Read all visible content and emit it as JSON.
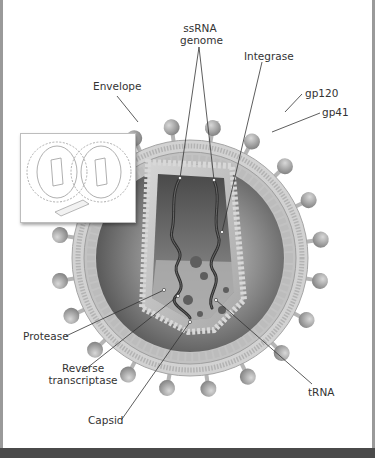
{
  "figure": {
    "labels": {
      "ssrna_line1": "ssRNA",
      "ssrna_line2": "genome",
      "integrase": "Integrase",
      "envelope": "Envelope",
      "gp120": "gp120",
      "gp41": "gp41",
      "protease": "Protease",
      "reverse_line1": "Reverse",
      "reverse_line2": "transcriptase",
      "trna": "tRNA",
      "capsid": "Capsid"
    },
    "inset": {
      "description": "two virions cross-section with scale bar",
      "scale_label": "80 nm"
    }
  },
  "colors": {
    "frame_border": "#9a9a9a",
    "bottom_bar": "#4a4a4a",
    "membrane": "#c8c8c8",
    "spike": "#a9a9a9",
    "interior": "#6e6e6e",
    "capsid": "#b8b8b8",
    "rna": "#3a3a3a",
    "label_text": "#333333"
  }
}
